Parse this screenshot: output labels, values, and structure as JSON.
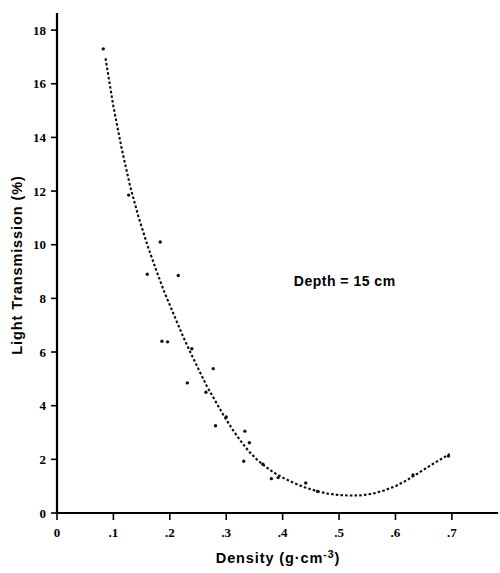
{
  "chart_data": {
    "type": "scatter",
    "title": "",
    "xlabel": "Density  (g·cm-3)",
    "xlabel_base": "Density  (g·cm",
    "xlabel_sup": "-3",
    "xlabel_close": ")",
    "ylabel": "Light Transmission  (%)",
    "xlim": [
      0,
      0.78
    ],
    "ylim": [
      0,
      18.6
    ],
    "grid": false,
    "legend": null,
    "xticks": [
      0,
      0.1,
      0.2,
      0.3,
      0.4,
      0.5,
      0.6,
      0.7
    ],
    "xtick_labels": [
      "0",
      ".1",
      ".2",
      ".3",
      ".4",
      ".5",
      ".6",
      ".7"
    ],
    "yticks": [
      0,
      2,
      4,
      6,
      8,
      10,
      12,
      14,
      16,
      18
    ],
    "ytick_labels": [
      "0",
      "2",
      "4",
      "6",
      "8",
      "10",
      "12",
      "14",
      "16",
      "18"
    ],
    "annotations": [
      {
        "text": "Depth = 15 cm",
        "x": 0.51,
        "y": 8.45
      }
    ],
    "series": [
      {
        "name": "Measured light transmission",
        "type": "scatter",
        "marker": "point",
        "color": "#111111",
        "points": [
          [
            0.082,
            17.3
          ],
          [
            0.127,
            11.85
          ],
          [
            0.16,
            8.9
          ],
          [
            0.183,
            10.1
          ],
          [
            0.186,
            6.4
          ],
          [
            0.196,
            6.38
          ],
          [
            0.215,
            8.85
          ],
          [
            0.231,
            4.85
          ],
          [
            0.239,
            6.12
          ],
          [
            0.264,
            4.5
          ],
          [
            0.277,
            5.38
          ],
          [
            0.281,
            3.25
          ],
          [
            0.3,
            3.58
          ],
          [
            0.331,
            1.93
          ],
          [
            0.333,
            3.05
          ],
          [
            0.341,
            2.62
          ],
          [
            0.365,
            1.82
          ],
          [
            0.38,
            1.28
          ],
          [
            0.392,
            1.32
          ],
          [
            0.441,
            1.12
          ],
          [
            0.462,
            0.8
          ],
          [
            0.631,
            1.42
          ],
          [
            0.694,
            2.12
          ]
        ]
      },
      {
        "name": "Fitted curve",
        "type": "line",
        "style": "dashed",
        "color": "#0d0d0d",
        "points": [
          [
            0.086,
            16.95
          ],
          [
            0.1,
            15.15
          ],
          [
            0.115,
            13.55
          ],
          [
            0.13,
            12.15
          ],
          [
            0.145,
            11.0
          ],
          [
            0.16,
            10.0
          ],
          [
            0.175,
            9.1
          ],
          [
            0.19,
            8.25
          ],
          [
            0.205,
            7.5
          ],
          [
            0.22,
            6.75
          ],
          [
            0.235,
            6.05
          ],
          [
            0.25,
            5.4
          ],
          [
            0.265,
            4.75
          ],
          [
            0.28,
            4.2
          ],
          [
            0.295,
            3.65
          ],
          [
            0.31,
            3.15
          ],
          [
            0.325,
            2.7
          ],
          [
            0.34,
            2.3
          ],
          [
            0.355,
            1.98
          ],
          [
            0.37,
            1.72
          ],
          [
            0.385,
            1.5
          ],
          [
            0.4,
            1.32
          ],
          [
            0.42,
            1.12
          ],
          [
            0.44,
            0.95
          ],
          [
            0.46,
            0.82
          ],
          [
            0.48,
            0.72
          ],
          [
            0.5,
            0.67
          ],
          [
            0.52,
            0.65
          ],
          [
            0.54,
            0.66
          ],
          [
            0.56,
            0.72
          ],
          [
            0.58,
            0.84
          ],
          [
            0.6,
            1.0
          ],
          [
            0.62,
            1.22
          ],
          [
            0.64,
            1.48
          ],
          [
            0.66,
            1.75
          ],
          [
            0.68,
            2.0
          ],
          [
            0.696,
            2.2
          ]
        ]
      }
    ]
  }
}
